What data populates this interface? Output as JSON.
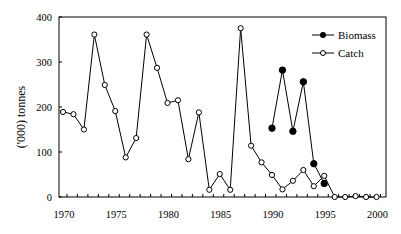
{
  "chart_data": {
    "type": "line",
    "title": "",
    "xlabel": "",
    "ylabel": "('000)  tonnes",
    "xlim": [
      1970,
      2000
    ],
    "ylim": [
      0,
      400
    ],
    "xticks": [
      1970,
      1975,
      1980,
      1985,
      1990,
      1995,
      2000
    ],
    "yticks": [
      0,
      100,
      200,
      300,
      400
    ],
    "grid": false,
    "legend_position": "upper right",
    "series": [
      {
        "name": "Biomass",
        "marker": "filled-circle",
        "color": "#000000",
        "x": [
          1990,
          1991,
          1992,
          1993,
          1994,
          1995
        ],
        "values": [
          153,
          282,
          146,
          256,
          74,
          30
        ]
      },
      {
        "name": "Catch",
        "marker": "open-circle",
        "color": "#000000",
        "x": [
          1970,
          1971,
          1972,
          1973,
          1974,
          1975,
          1976,
          1977,
          1978,
          1979,
          1980,
          1981,
          1982,
          1983,
          1984,
          1985,
          1986,
          1987,
          1988,
          1989,
          1990,
          1991,
          1992,
          1993,
          1994,
          1995,
          1996,
          1997,
          1998,
          1999,
          2000
        ],
        "values": [
          189,
          184,
          150,
          361,
          249,
          191,
          88,
          131,
          361,
          287,
          209,
          215,
          84,
          188,
          16,
          51,
          16,
          375,
          114,
          77,
          49,
          17,
          36,
          60,
          24,
          47,
          0,
          0,
          2,
          0,
          0
        ]
      }
    ]
  },
  "legend": {
    "items": [
      {
        "label": "Biomass"
      },
      {
        "label": "Catch"
      }
    ]
  }
}
